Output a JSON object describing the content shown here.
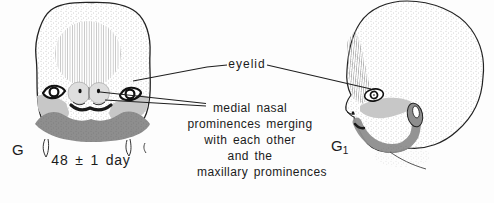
{
  "labels": {
    "eyelid": "eyelid",
    "annotation_lines": [
      "medial nasal",
      "prominences merging",
      "with each other",
      "and the",
      "maxillary prominences"
    ],
    "left_view_letter": "G",
    "age": "48 ± 1 day",
    "right_view_letter": "G",
    "right_view_subscript": "1"
  },
  "colors": {
    "ink": "#1c1c1c",
    "light_gray": "#c7c7c7",
    "mid_gray": "#8e8e8e",
    "pale_gray": "#dedede",
    "paper": "#fdfdfd"
  }
}
